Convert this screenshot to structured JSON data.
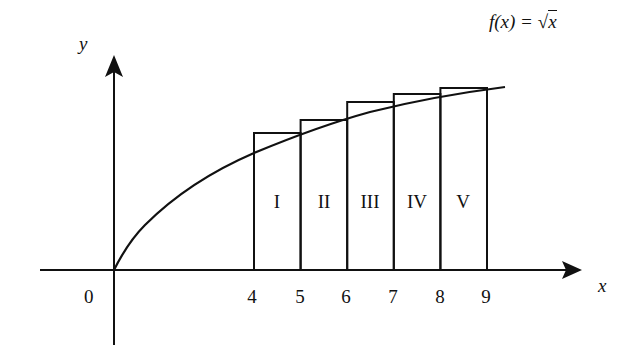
{
  "diagram": {
    "function_label": "f(x) = √x",
    "function_label_parts": {
      "lhs": "f(x) = ",
      "radicand": "x"
    },
    "axes": {
      "x_label": "x",
      "y_label": "y",
      "origin_label": "0"
    },
    "x_ticks": [
      "4",
      "5",
      "6",
      "7",
      "8",
      "9"
    ],
    "rectangles": [
      {
        "label": "I",
        "x_from": 4,
        "x_to": 5,
        "height": "√5"
      },
      {
        "label": "II",
        "x_from": 5,
        "x_to": 6,
        "height": "√6"
      },
      {
        "label": "III",
        "x_from": 6,
        "x_to": 7,
        "height": "√7"
      },
      {
        "label": "IV",
        "x_from": 7,
        "x_to": 8,
        "height": "√8"
      },
      {
        "label": "V",
        "x_from": 8,
        "x_to": 9,
        "height": "√9"
      }
    ],
    "colors": {
      "stroke": "#111111",
      "background": "#ffffff"
    }
  }
}
